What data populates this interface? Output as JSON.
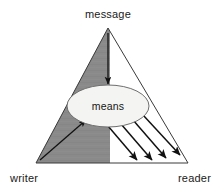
{
  "diagram": {
    "title_label": "message",
    "left_corner_label": "writer",
    "right_corner_label": "reader",
    "center_node_label": "means",
    "colors": {
      "background": "#ffffff",
      "shade_fill": "#8a8a8a",
      "outline": "#3a3a3a",
      "ellipse_fill": "#f4f4f2",
      "ellipse_stroke": "#6e6e6e",
      "arrow": "#111111",
      "text": "#1a1a1a"
    },
    "geometry": {
      "apex": {
        "x": 108,
        "y": 28
      },
      "base_left": {
        "x": 36,
        "y": 163
      },
      "base_right": {
        "x": 188,
        "y": 163
      },
      "shade_divider_x": 110,
      "ellipse": {
        "cx": 108,
        "cy": 106,
        "rx": 41,
        "ry": 21
      }
    },
    "arrows": {
      "message_to_means": {
        "label": "message-to-means-arrow",
        "from": {
          "x": 108,
          "y": 33
        },
        "to": {
          "x": 108,
          "y": 84
        }
      },
      "writer_to_means": {
        "label": "writer-to-means-arrow",
        "from": {
          "x": 40,
          "y": 160
        },
        "to": {
          "x": 86,
          "y": 120
        }
      },
      "means_to_reader": [
        {
          "from": {
            "x": 108,
            "y": 126
          },
          "to": {
            "x": 137,
            "y": 160
          }
        },
        {
          "from": {
            "x": 121,
            "y": 124
          },
          "to": {
            "x": 152,
            "y": 160
          }
        },
        {
          "from": {
            "x": 133,
            "y": 120
          },
          "to": {
            "x": 166,
            "y": 158
          }
        },
        {
          "from": {
            "x": 143,
            "y": 115
          },
          "to": {
            "x": 180,
            "y": 155
          }
        }
      ]
    }
  }
}
